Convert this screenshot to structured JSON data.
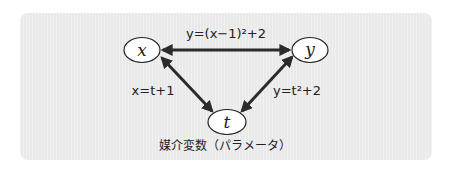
{
  "diagram": {
    "type": "relationship-triangle",
    "background_color": "#e9e9e9",
    "arrow_color": "#2b2b2b",
    "nodes": [
      {
        "id": "x",
        "label": "x",
        "cx": 142,
        "cy": 50
      },
      {
        "id": "y",
        "label": "y",
        "cx": 310,
        "cy": 50
      },
      {
        "id": "t",
        "label": "t",
        "cx": 227,
        "cy": 122
      }
    ],
    "edges": [
      {
        "from": "x",
        "to": "y",
        "label": "y=(x−1)²+2",
        "bidirectional": true
      },
      {
        "from": "x",
        "to": "t",
        "label": "x=t+1",
        "bidirectional": true
      },
      {
        "from": "y",
        "to": "t",
        "label": "y=t²+2",
        "bidirectional": true
      }
    ],
    "caption": "媒介変数（パラメータ）"
  }
}
